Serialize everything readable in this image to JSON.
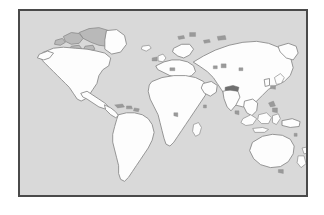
{
  "figure": {
    "kind": "world-map-illustration",
    "frame_color": "#4a4a4a",
    "ocean_color": "#d9d9d9",
    "land_fill_color": "#fdfdfd",
    "coastline_color": "#8a8a8a",
    "shaded_land_color": "#6f6f6f",
    "page_background_color": "#ffffff",
    "projection_note": "equirectangular world outline"
  },
  "map": {
    "landmasses": [
      {
        "id": "north-america",
        "label": "North America"
      },
      {
        "id": "greenland",
        "label": "Greenland"
      },
      {
        "id": "canadian-arctic",
        "label": "Canadian Arctic Archipelago"
      },
      {
        "id": "central-america",
        "label": "Central America"
      },
      {
        "id": "caribbean",
        "label": "Caribbean Islands"
      },
      {
        "id": "south-america",
        "label": "South America"
      },
      {
        "id": "europe",
        "label": "Europe"
      },
      {
        "id": "british-isles",
        "label": "British Isles"
      },
      {
        "id": "iceland",
        "label": "Iceland"
      },
      {
        "id": "scandinavia",
        "label": "Scandinavia"
      },
      {
        "id": "africa",
        "label": "Africa"
      },
      {
        "id": "madagascar",
        "label": "Madagascar"
      },
      {
        "id": "asia",
        "label": "Asia"
      },
      {
        "id": "india",
        "label": "Indian Subcontinent"
      },
      {
        "id": "arabia",
        "label": "Arabian Peninsula"
      },
      {
        "id": "japan",
        "label": "Japan"
      },
      {
        "id": "southeast-asia",
        "label": "Southeast Asia"
      },
      {
        "id": "indonesia",
        "label": "Indonesian Archipelago"
      },
      {
        "id": "philippines",
        "label": "Philippines"
      },
      {
        "id": "new-guinea",
        "label": "New Guinea"
      },
      {
        "id": "australia",
        "label": "Australia"
      },
      {
        "id": "new-zealand",
        "label": "New Zealand"
      },
      {
        "id": "sri-lanka",
        "label": "Sri Lanka"
      },
      {
        "id": "borneo",
        "label": "Borneo"
      },
      {
        "id": "sumatra",
        "label": "Sumatra"
      }
    ],
    "oceans": [
      {
        "id": "pacific-ocean",
        "label": "Pacific Ocean"
      },
      {
        "id": "atlantic-ocean",
        "label": "Atlantic Ocean"
      },
      {
        "id": "indian-ocean",
        "label": "Indian Ocean"
      }
    ]
  }
}
